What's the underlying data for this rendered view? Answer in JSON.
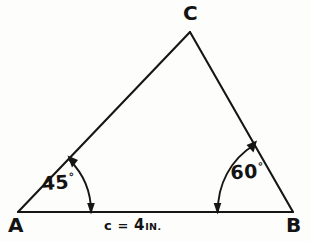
{
  "figure": {
    "type": "triangle-diagram",
    "background_color": "#fdfdfc",
    "ink_color": "#161616",
    "vertices": [
      {
        "name": "A",
        "label": "A",
        "x": 18,
        "y": 212
      },
      {
        "name": "B",
        "label": "B",
        "x": 293,
        "y": 212
      },
      {
        "name": "C",
        "label": "C",
        "x": 190,
        "y": 32
      }
    ],
    "sides": [
      {
        "name": "AB",
        "from": "A",
        "to": "B",
        "label": "c = 4 IN.",
        "label_value": "4",
        "label_unit": "IN."
      },
      {
        "name": "AC",
        "from": "A",
        "to": "C",
        "label": ""
      },
      {
        "name": "CB",
        "from": "C",
        "to": "B",
        "label": ""
      }
    ],
    "angles": [
      {
        "at": "A",
        "value": "45",
        "unit": "°",
        "label": "45°",
        "arc_radius": 73,
        "arrow_both_ends": true
      },
      {
        "at": "B",
        "value": "60",
        "unit": "°",
        "label": "60°",
        "arc_radius": 76,
        "arrow_both_ends": true
      }
    ],
    "labels": {
      "vertex_a": "A",
      "vertex_b": "B",
      "vertex_c": "C",
      "angle_a_number": "45",
      "angle_a_degree": "°",
      "angle_b_number": "60",
      "angle_b_degree": "°",
      "side_c_name": "c",
      "side_c_equals": "=",
      "side_c_value": "4",
      "side_c_unit": "IN."
    }
  }
}
